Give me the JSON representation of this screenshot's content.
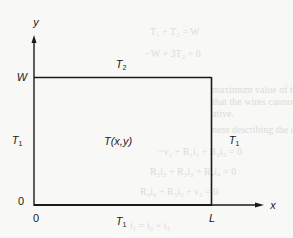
{
  "diagram": {
    "type": "rectangular domain with boundary temperatures",
    "axes": {
      "x_label": "x",
      "y_label": "y",
      "origin_x_label": "0",
      "origin_y_label": "0"
    },
    "dimensions": {
      "width_label": "L",
      "height_label": "W"
    },
    "boundaries": {
      "top": {
        "symbol": "T",
        "subscript": "2"
      },
      "left": {
        "symbol": "T",
        "subscript": "1"
      },
      "right": {
        "symbol": "T",
        "subscript": "1"
      },
      "bottom": {
        "symbol": "T",
        "subscript": "1"
      }
    },
    "interior_label": "T(x,y)",
    "colors": {
      "line": "#1a1a1a",
      "background": "#f8f8f6",
      "bleed_text": "#dcdcd8"
    }
  },
  "background_bleed_text": [
    "T₁ + T₂ = W",
    "−W + 3T₂ = 0",
    "maximum value of the weight W the structure can",
    "that the wires cannot support compression, so T",
    "ative.",
    "nent describing the circuit shown in Figure",
    "−v₁ + R₁i₁ + R₂i₂ = 0",
    "R₂i₂ + R₃i₃ + R₄i₄ = 0",
    "R₄i₄ + R₅i₅ + v₂ = 0",
    "i₁ = i₂ + i₃"
  ]
}
